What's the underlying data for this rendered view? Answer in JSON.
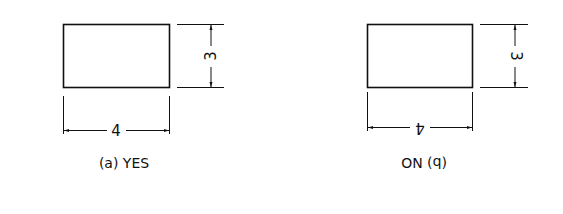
{
  "figure_a": {
    "label": "(a) YES",
    "width_dimension": "4",
    "height_dimension": "3"
  },
  "figure_b": {
    "label": "(b) NO",
    "width_dimension": "4",
    "height_dimension": "3"
  },
  "colors": {
    "line": "#111111",
    "background": "#ffffff"
  }
}
